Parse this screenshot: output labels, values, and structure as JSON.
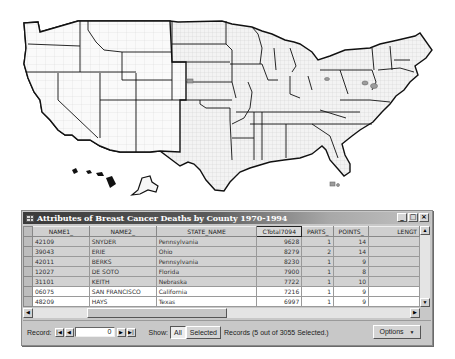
{
  "map": {
    "description": "US county map with state boundaries; selected counties highlighted",
    "selected_highlight_color": "#9a9a9a",
    "state_border_color": "#111111",
    "county_border_color": "#c4c4c4"
  },
  "window": {
    "title": "Attributes of Breast Cancer Deaths by County 1970-1994",
    "controls": {
      "minimize": "_",
      "maximize": "□",
      "close": "×"
    }
  },
  "table": {
    "columns": [
      "NAME1_",
      "NAME2_",
      "STATE_NAME",
      "CTotal7094",
      "PARTS_",
      "POINTS_",
      "LENGT"
    ],
    "sorted_column": "CTotal7094",
    "rows": [
      {
        "NAME1_": "42109",
        "NAME2_": "SNYDER",
        "STATE_NAME": "Pennsylvania",
        "CTotal7094": "9628",
        "PARTS_": "1",
        "POINTS_": "14",
        "LENGT": "",
        "selected": true
      },
      {
        "NAME1_": "39043",
        "NAME2_": "ERIE",
        "STATE_NAME": "Ohio",
        "CTotal7094": "8279",
        "PARTS_": "2",
        "POINTS_": "14",
        "LENGT": "",
        "selected": true
      },
      {
        "NAME1_": "42011",
        "NAME2_": "BERKS",
        "STATE_NAME": "Pennsylvania",
        "CTotal7094": "8230",
        "PARTS_": "1",
        "POINTS_": "9",
        "LENGT": "",
        "selected": true
      },
      {
        "NAME1_": "12027",
        "NAME2_": "DE SOTO",
        "STATE_NAME": "Florida",
        "CTotal7094": "7900",
        "PARTS_": "1",
        "POINTS_": "8",
        "LENGT": "",
        "selected": true
      },
      {
        "NAME1_": "31101",
        "NAME2_": "KEITH",
        "STATE_NAME": "Nebraska",
        "CTotal7094": "7722",
        "PARTS_": "1",
        "POINTS_": "10",
        "LENGT": "",
        "selected": true
      },
      {
        "NAME1_": "06075",
        "NAME2_": "SAN FRANCISCO",
        "STATE_NAME": "California",
        "CTotal7094": "7216",
        "PARTS_": "1",
        "POINTS_": "9",
        "LENGT": "",
        "selected": false
      },
      {
        "NAME1_": "48209",
        "NAME2_": "HAYS",
        "STATE_NAME": "Texas",
        "CTotal7094": "6997",
        "PARTS_": "1",
        "POINTS_": "9",
        "LENGT": "",
        "selected": false
      }
    ]
  },
  "footer": {
    "record_label": "Record:",
    "record_value": "0",
    "show_label": "Show:",
    "all_label": "All",
    "selected_label": "Selected",
    "records_status": "Records  (5 out of 3055 Selected.)",
    "options_label": "Options",
    "nav": {
      "first": "|◀",
      "prev": "◀",
      "next": "▶",
      "last": "▶|"
    }
  }
}
